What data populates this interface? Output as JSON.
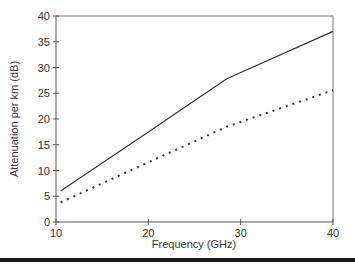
{
  "chart_data": {
    "type": "line",
    "title": "",
    "xlabel": "Frequency (GHz)",
    "ylabel": "Attenuation per km  (dB)",
    "xlim": [
      10,
      40
    ],
    "ylim": [
      0,
      40
    ],
    "xticks": [
      10,
      20,
      30,
      40
    ],
    "yticks": [
      0,
      5,
      10,
      15,
      20,
      25,
      30,
      35,
      40
    ],
    "xtick_labels": [
      "10",
      "20",
      "30",
      "40"
    ],
    "ytick_labels": [
      "0",
      "5",
      "10",
      "15",
      "20",
      "25",
      "30",
      "35",
      "40"
    ],
    "grid": false,
    "legend": null,
    "series": [
      {
        "name": "solid",
        "style": "solid",
        "color": "#333333",
        "x": [
          10.5,
          20,
          28.5,
          40
        ],
        "y": [
          6.0,
          17.5,
          27.8,
          37.0
        ]
      },
      {
        "name": "dotted",
        "style": "dotted",
        "color": "#333333",
        "x": [
          10.5,
          20,
          28.5,
          40
        ],
        "y": [
          3.8,
          11.6,
          18.5,
          25.6
        ]
      }
    ]
  }
}
